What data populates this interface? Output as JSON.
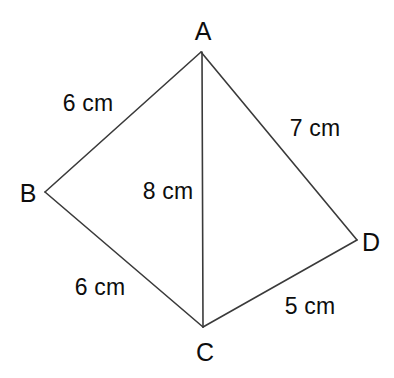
{
  "figure": {
    "kind": "geometry-diagram",
    "shape_name": "quadrilateral ABCD with diagonal AC",
    "background_color": "#ffffff",
    "stroke_color": "#3a3a3a",
    "stroke_width_px": 1.6,
    "text_color": "#0d0d0d",
    "canvas": {
      "width": 394,
      "height": 378
    },
    "vertices": [
      {
        "name": "A",
        "label": "A",
        "x": 201,
        "y": 52,
        "label_x": 203,
        "label_y": 31
      },
      {
        "name": "B",
        "label": "B",
        "x": 45,
        "y": 192,
        "label_x": 28,
        "label_y": 193
      },
      {
        "name": "C",
        "label": "C",
        "x": 203,
        "y": 327,
        "label_x": 205,
        "label_y": 352
      },
      {
        "name": "D",
        "label": "D",
        "x": 357,
        "y": 240,
        "label_x": 371,
        "label_y": 242
      }
    ],
    "edges": [
      {
        "name": "edge-AB",
        "from": "A",
        "to": "B",
        "x1": 201,
        "y1": 52,
        "x2": 45,
        "y2": 192
      },
      {
        "name": "edge-BC",
        "from": "B",
        "to": "C",
        "x1": 45,
        "y1": 192,
        "x2": 203,
        "y2": 327
      },
      {
        "name": "edge-CD",
        "from": "C",
        "to": "D",
        "x1": 203,
        "y1": 327,
        "x2": 357,
        "y2": 240
      },
      {
        "name": "edge-DA",
        "from": "D",
        "to": "A",
        "x1": 357,
        "y1": 240,
        "x2": 201,
        "y2": 52
      },
      {
        "name": "diagonal-AC",
        "from": "A",
        "to": "C",
        "x1": 202,
        "y1": 52,
        "x2": 203,
        "y2": 327
      }
    ],
    "measurements": [
      {
        "name": "length-AB",
        "edge": "AB",
        "text": "6 cm",
        "value": 6,
        "unit": "cm",
        "x": 88,
        "y": 103
      },
      {
        "name": "length-AD",
        "edge": "AD",
        "text": "7 cm",
        "value": 7,
        "unit": "cm",
        "x": 315,
        "y": 128
      },
      {
        "name": "length-AC",
        "edge": "AC",
        "text": "8 cm",
        "value": 8,
        "unit": "cm",
        "x": 168,
        "y": 191
      },
      {
        "name": "length-BC",
        "edge": "BC",
        "text": "6 cm",
        "value": 6,
        "unit": "cm",
        "x": 100,
        "y": 287
      },
      {
        "name": "length-CD",
        "edge": "CD",
        "text": "5 cm",
        "value": 5,
        "unit": "cm",
        "x": 310,
        "y": 306
      }
    ]
  }
}
